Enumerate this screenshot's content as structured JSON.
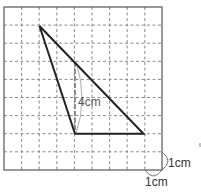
{
  "diagram": {
    "type": "geometry-triangle-on-grid",
    "grid": {
      "columns": 9,
      "rows": 9,
      "cell_size_label": "1cm",
      "origin_px": [
        4,
        7
      ],
      "cell_px": 17.6,
      "line_color": "#888888",
      "border_color": "#555555"
    },
    "triangle": {
      "vertices_grid": [
        [
          2,
          1
        ],
        [
          4,
          7
        ],
        [
          8,
          7
        ]
      ],
      "stroke_color": "#222222"
    },
    "height": {
      "x_grid": 4,
      "from_y_grid": 3,
      "to_y_grid": 7,
      "label": "4cm"
    },
    "unit_labels": {
      "horizontal": "1cm",
      "vertical": "1cm"
    }
  }
}
